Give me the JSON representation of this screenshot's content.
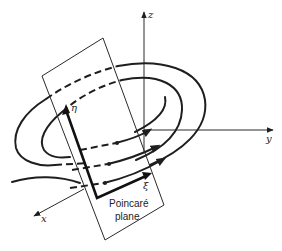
{
  "figure": {
    "axes": {
      "z_label": "z",
      "y_label": "y",
      "x_label": "x"
    },
    "plane_coordinates": {
      "eta_label": "η",
      "xi_label": "ξ"
    },
    "plane_label": {
      "line1": "Poincaré",
      "line2": "plane"
    },
    "colors": {
      "ink": "#1e1e1e",
      "background": "#ffffff"
    }
  }
}
